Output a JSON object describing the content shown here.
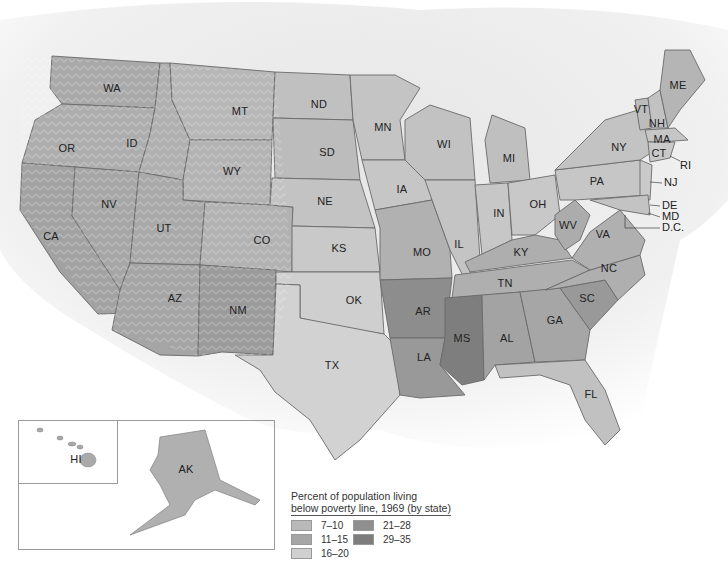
{
  "map": {
    "title": "Percent of population living below poverty line, 1969 (by state)",
    "legend": {
      "title_line1": "Percent of population living",
      "title_line2": "below poverty line, 1969 (by state)",
      "classes": [
        {
          "range": "7–10",
          "color": "#b9b9b9"
        },
        {
          "range": "11–15",
          "color": "#a6a6a6"
        },
        {
          "range": "16–20",
          "color": "#d0d0d0"
        },
        {
          "range": "21–28",
          "color": "#8f8f8f"
        },
        {
          "range": "29–35",
          "color": "#7d7d7d"
        }
      ]
    },
    "states": [
      {
        "abbr": "WA",
        "x": 112,
        "y": 88
      },
      {
        "abbr": "OR",
        "x": 67,
        "y": 148
      },
      {
        "abbr": "ID",
        "x": 132,
        "y": 143
      },
      {
        "abbr": "MT",
        "x": 240,
        "y": 111
      },
      {
        "abbr": "WY",
        "x": 232,
        "y": 171
      },
      {
        "abbr": "NV",
        "x": 109,
        "y": 204
      },
      {
        "abbr": "UT",
        "x": 164,
        "y": 228
      },
      {
        "abbr": "CA",
        "x": 51,
        "y": 236
      },
      {
        "abbr": "CO",
        "x": 262,
        "y": 240
      },
      {
        "abbr": "AZ",
        "x": 175,
        "y": 298
      },
      {
        "abbr": "NM",
        "x": 238,
        "y": 310
      },
      {
        "abbr": "ND",
        "x": 319,
        "y": 104
      },
      {
        "abbr": "SD",
        "x": 327,
        "y": 152
      },
      {
        "abbr": "NE",
        "x": 325,
        "y": 201
      },
      {
        "abbr": "KS",
        "x": 339,
        "y": 248
      },
      {
        "abbr": "OK",
        "x": 354,
        "y": 300
      },
      {
        "abbr": "TX",
        "x": 332,
        "y": 365
      },
      {
        "abbr": "MN",
        "x": 383,
        "y": 127
      },
      {
        "abbr": "IA",
        "x": 402,
        "y": 189
      },
      {
        "abbr": "MO",
        "x": 422,
        "y": 252
      },
      {
        "abbr": "AR",
        "x": 423,
        "y": 311
      },
      {
        "abbr": "LA",
        "x": 424,
        "y": 357
      },
      {
        "abbr": "WI",
        "x": 444,
        "y": 144
      },
      {
        "abbr": "IL",
        "x": 459,
        "y": 244
      },
      {
        "abbr": "MI",
        "x": 509,
        "y": 158
      },
      {
        "abbr": "IN",
        "x": 499,
        "y": 213
      },
      {
        "abbr": "OH",
        "x": 538,
        "y": 204
      },
      {
        "abbr": "KY",
        "x": 521,
        "y": 252
      },
      {
        "abbr": "TN",
        "x": 505,
        "y": 283
      },
      {
        "abbr": "MS",
        "x": 462,
        "y": 338
      },
      {
        "abbr": "AL",
        "x": 507,
        "y": 338
      },
      {
        "abbr": "GA",
        "x": 555,
        "y": 320
      },
      {
        "abbr": "FL",
        "x": 591,
        "y": 394
      },
      {
        "abbr": "SC",
        "x": 587,
        "y": 298
      },
      {
        "abbr": "NC",
        "x": 609,
        "y": 268
      },
      {
        "abbr": "VA",
        "x": 603,
        "y": 234
      },
      {
        "abbr": "WV",
        "x": 568,
        "y": 225
      },
      {
        "abbr": "PA",
        "x": 597,
        "y": 181
      },
      {
        "abbr": "NY",
        "x": 619,
        "y": 147
      },
      {
        "abbr": "VT",
        "x": 641,
        "y": 109
      },
      {
        "abbr": "NH",
        "x": 657,
        "y": 123
      },
      {
        "abbr": "ME",
        "x": 678,
        "y": 85
      },
      {
        "abbr": "MA",
        "x": 662,
        "y": 139
      },
      {
        "abbr": "CT",
        "x": 659,
        "y": 153
      },
      {
        "abbr": "HI",
        "x": 76,
        "y": 459
      },
      {
        "abbr": "AK",
        "x": 186,
        "y": 469
      }
    ],
    "callouts": [
      {
        "abbr": "RI",
        "x": 680,
        "y": 166
      },
      {
        "abbr": "NJ",
        "x": 664,
        "y": 183
      },
      {
        "abbr": "DE",
        "x": 662,
        "y": 206
      },
      {
        "abbr": "MD",
        "x": 662,
        "y": 217
      },
      {
        "abbr": "D.C.",
        "x": 662,
        "y": 228
      }
    ]
  }
}
